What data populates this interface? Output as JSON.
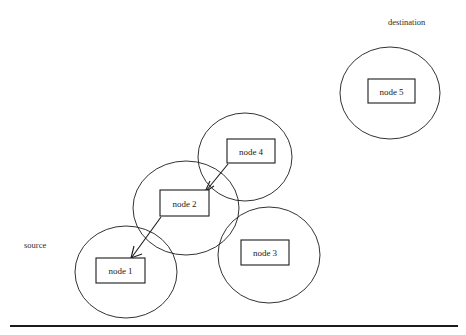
{
  "diagram": {
    "background_color": "#ffffff",
    "stroke_color": "#1c1c1c",
    "annotations": [
      {
        "id": "source",
        "label": "source",
        "x": 24,
        "y": 248
      },
      {
        "id": "destination",
        "label": "destination",
        "x": 388,
        "y": 25
      }
    ],
    "clusters": [
      {
        "id": "cluster-node-1",
        "cx": 126,
        "cy": 272,
        "rx": 51,
        "ry": 46
      },
      {
        "id": "cluster-node-2",
        "cx": 186,
        "cy": 208,
        "rx": 53,
        "ry": 47
      },
      {
        "id": "cluster-node-3",
        "cx": 269,
        "cy": 255,
        "rx": 51,
        "ry": 48
      },
      {
        "id": "cluster-node-4",
        "cx": 245,
        "cy": 157,
        "rx": 47,
        "ry": 44
      },
      {
        "id": "cluster-node-5",
        "cx": 390,
        "cy": 93,
        "rx": 50,
        "ry": 46
      }
    ],
    "nodes": [
      {
        "id": "node-1",
        "label": "node 1",
        "x": 96,
        "y": 258,
        "w": 49,
        "h": 25
      },
      {
        "id": "node-2",
        "label": "node 2",
        "x": 160,
        "y": 190,
        "w": 49,
        "h": 26
      },
      {
        "id": "node-3",
        "label": "node 3",
        "x": 241,
        "y": 240,
        "w": 48,
        "h": 25
      },
      {
        "id": "node-4",
        "label": "node 4",
        "x": 227,
        "y": 139,
        "w": 48,
        "h": 24
      },
      {
        "id": "node-5",
        "label": "node 5",
        "x": 368,
        "y": 79,
        "w": 47,
        "h": 24
      }
    ],
    "edges": [
      {
        "id": "edge-node4-to-node2",
        "from": "node-4",
        "to": "node-2",
        "x1": 228,
        "y1": 164,
        "x2": 206,
        "y2": 191,
        "arrow": "end"
      },
      {
        "id": "edge-node2-to-node1",
        "from": "node-2",
        "to": "node-1",
        "x1": 161,
        "y1": 217,
        "x2": 132,
        "y2": 257,
        "arrow": "end"
      }
    ],
    "footer_rule": {
      "x1": 10,
      "y1": 326,
      "x2": 458,
      "y2": 326
    }
  }
}
